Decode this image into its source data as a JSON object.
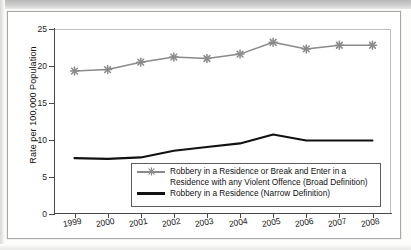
{
  "chart_data": {
    "type": "line",
    "title": "",
    "xlabel": "",
    "ylabel": "Rate per 100,000 Population",
    "categories": [
      "1999",
      "2000",
      "2001",
      "2002",
      "2003",
      "2004",
      "2005",
      "2006",
      "2007",
      "2008"
    ],
    "x": [
      1999,
      2000,
      2001,
      2002,
      2003,
      2004,
      2005,
      2006,
      2007,
      2008
    ],
    "ylim": [
      0,
      25
    ],
    "yticks": [
      0,
      5,
      10,
      15,
      20,
      25
    ],
    "ytick_labels": [
      "0",
      "5",
      "10",
      "15",
      "20",
      "25"
    ],
    "xtick_labels": [
      "1999",
      "2000",
      "2001",
      "2002",
      "2003",
      "2004",
      "2005",
      "2006",
      "2007",
      "2008"
    ],
    "grid": false,
    "legend_position": "lower-center-inside",
    "series": [
      {
        "name": "Robbery in a Residence or Break and Enter in a Residence with any Violent Offence (Broad Definition)",
        "label_line_1": "Robbery in a Residence or Break and Enter in a",
        "label_line_2": "Residence with any Violent Offence (Broad Definition)",
        "marker": "asterisk",
        "color": "#8a8a8a",
        "values": [
          19.3,
          19.5,
          20.5,
          21.2,
          21.0,
          21.6,
          23.2,
          22.3,
          22.8,
          22.8
        ]
      },
      {
        "name": "Robbery in a Residence (Narrow Definition)",
        "label_line_1": "Robbery in a Residence (Narrow Definition)",
        "marker": "none",
        "color": "#111111",
        "values": [
          7.5,
          7.4,
          7.6,
          8.5,
          9.0,
          9.5,
          10.7,
          9.9,
          9.9,
          9.9
        ]
      }
    ]
  },
  "axes": {
    "y_axis_title": "Rate per 100,000 Population"
  },
  "legend": {
    "entries": [
      {
        "icon": "line-with-asterisk-marker",
        "line_1": "Robbery in a Residence or Break and Enter in a",
        "line_2": "Residence with any Violent Offence (Broad Definition)"
      },
      {
        "icon": "thick-black-line",
        "line_1": "Robbery in a Residence (Narrow Definition)"
      }
    ]
  },
  "colors": {
    "broad_series": "#8a8a8a",
    "narrow_series": "#111111",
    "axis": "#4a4a4a",
    "plot_border": "#bdbdbb",
    "frame": "#a8a8a6"
  }
}
